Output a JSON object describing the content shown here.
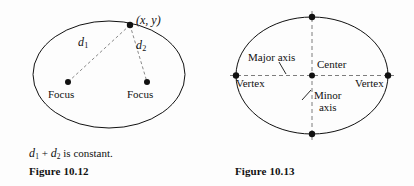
{
  "page": {
    "background_color": "#fdfdfd",
    "ink_color": "#111111",
    "dash_color": "#6b6b6b",
    "width": 414,
    "height": 186
  },
  "figures": [
    {
      "id": "figure-10-12",
      "caption_text": "is constant.",
      "caption_prefix_d1": "d",
      "caption_sub1": "1",
      "caption_plus": "+",
      "caption_prefix_d2": "d",
      "caption_sub2": "2",
      "figure_number": "Figure 10.12",
      "ellipse": {
        "cx": 109,
        "cy": 74.5,
        "rx": 76,
        "ry": 53.5,
        "stroke": "#111111",
        "stroke_width": 1
      },
      "point_label": "(x, y)",
      "points": [
        {
          "name": "point-on-ellipse",
          "x": 130,
          "y": 25,
          "r": 3.2
        },
        {
          "name": "focus-left-dot",
          "x": 68,
          "y": 82,
          "r": 3.0
        },
        {
          "name": "focus-right-dot",
          "x": 147,
          "y": 82,
          "r": 3.0
        }
      ],
      "focus_left_label": "Focus",
      "focus_right_label": "Focus",
      "distance_labels": [
        {
          "name": "d1",
          "letter": "d",
          "sub": "1",
          "x": 80,
          "y": 40
        },
        {
          "name": "d2",
          "letter": "d",
          "sub": "2",
          "x": 138,
          "y": 43
        }
      ],
      "segments": [
        {
          "name": "d1-segment",
          "x1": 130,
          "y1": 25,
          "x2": 68,
          "y2": 82
        },
        {
          "name": "d2-segment",
          "x1": 130,
          "y1": 25,
          "x2": 147,
          "y2": 82
        }
      ]
    },
    {
      "id": "figure-10-13",
      "figure_number": "Figure 10.13",
      "ellipse": {
        "cx": 312,
        "cy": 75.5,
        "rx": 76,
        "ry": 58.5,
        "stroke": "#111111",
        "stroke_width": 1
      },
      "axes": {
        "major_axis_label": "Major axis",
        "minor_axis_label_line1": "Minor",
        "minor_axis_label_line2": "axis",
        "center_label": "Center",
        "vertex_left_label": "Vertex",
        "vertex_right_label": "Vertex"
      },
      "points": [
        {
          "name": "vertex-left-dot",
          "x": 236,
          "y": 75.5,
          "r": 3.2
        },
        {
          "name": "vertex-right-dot",
          "x": 388,
          "y": 75.5,
          "r": 3.2
        },
        {
          "name": "covertex-top-dot",
          "x": 312,
          "y": 17,
          "r": 3.2
        },
        {
          "name": "covertex-bottom-dot",
          "x": 312,
          "y": 134,
          "r": 3.2
        },
        {
          "name": "center-dot",
          "x": 312,
          "y": 75.5,
          "r": 3.0
        }
      ],
      "dashed_axes": [
        {
          "name": "major-axis-line",
          "x1": 230,
          "y1": 75.5,
          "x2": 394,
          "y2": 75.5
        },
        {
          "name": "minor-axis-line",
          "x1": 312,
          "y1": 11,
          "x2": 312,
          "y2": 140
        }
      ],
      "leader_lines": [
        {
          "name": "major-axis-leader",
          "x1": 279,
          "y1": 63,
          "x2": 286,
          "y2": 74
        },
        {
          "name": "minor-axis-leader",
          "x1": 311,
          "y1": 90,
          "x2": 303,
          "y2": 99
        }
      ]
    }
  ]
}
